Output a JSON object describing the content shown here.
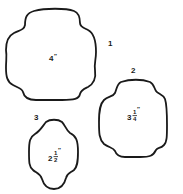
{
  "diagram": {
    "type": "pattern-templates",
    "shapes": [
      {
        "id": "1",
        "number_label": "1",
        "size_label": "4″",
        "size_whole": "4",
        "size_frac_num": "",
        "size_frac_den": "",
        "size_unit": "″"
      },
      {
        "id": "2",
        "number_label": "2",
        "size_label": "3¼″",
        "size_whole": "3",
        "size_frac_num": "1",
        "size_frac_den": "4",
        "size_unit": "″"
      },
      {
        "id": "3",
        "number_label": "3",
        "size_label": "2½″",
        "size_whole": "2",
        "size_frac_num": "1",
        "size_frac_den": "2",
        "size_unit": "″"
      }
    ],
    "colors": {
      "stroke": "#1a1a1a",
      "background": "#ffffff"
    }
  }
}
